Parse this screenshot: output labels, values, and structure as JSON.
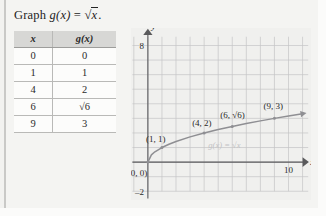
{
  "problem": {
    "prompt_prefix": "Graph ",
    "prompt_fn": "g(x)",
    "prompt_eq": " = ",
    "radical_sign": "√",
    "radicand": "x",
    "prompt_suffix": "."
  },
  "table": {
    "headers": [
      "x",
      "g(x)"
    ],
    "rows": [
      {
        "x": "0",
        "gx": "0"
      },
      {
        "x": "1",
        "gx": "1"
      },
      {
        "x": "4",
        "gx": "2"
      },
      {
        "x": "6",
        "gx": "√6"
      },
      {
        "x": "9",
        "gx": "3"
      }
    ]
  },
  "chart_data": {
    "type": "line",
    "title": "",
    "xlabel": "x",
    "ylabel": "y",
    "xlim": [
      -1.2,
      11.6
    ],
    "ylim": [
      -2.6,
      9.2
    ],
    "grid": true,
    "grid_step": 1,
    "x_ticks": [
      {
        "value": 10,
        "label": "10"
      }
    ],
    "y_ticks": [
      {
        "value": 8,
        "label": "8"
      },
      {
        "value": -2,
        "label": "–2"
      }
    ],
    "series": [
      {
        "name": "g(x) = √x",
        "expression_label": "g(x) = √x",
        "x": [
          0,
          0.25,
          0.5,
          1,
          1.5,
          2,
          3,
          4,
          5,
          6,
          7,
          8,
          9,
          10,
          11
        ],
        "y": [
          0,
          0.5,
          0.707,
          1,
          1.225,
          1.414,
          1.732,
          2,
          2.236,
          2.449,
          2.646,
          2.828,
          3,
          3.162,
          3.317
        ]
      }
    ],
    "points": [
      {
        "x": 0,
        "y": 0,
        "label": "(0, 0)"
      },
      {
        "x": 1,
        "y": 1,
        "label": "(1, 1)"
      },
      {
        "x": 4,
        "y": 2,
        "label": "(4, 2)"
      },
      {
        "x": 6,
        "y": 2.449,
        "label": "(6, √6)"
      },
      {
        "x": 9,
        "y": 3,
        "label": "(9, 3)"
      }
    ],
    "colors": {
      "curve": "#8f8f93",
      "grid": "#c4c4c6",
      "axis": "#5a5a5c",
      "point_label": "#2a2a2a",
      "function_label": "#c2c2c4",
      "plot_bg": "#f0f0ee"
    }
  }
}
